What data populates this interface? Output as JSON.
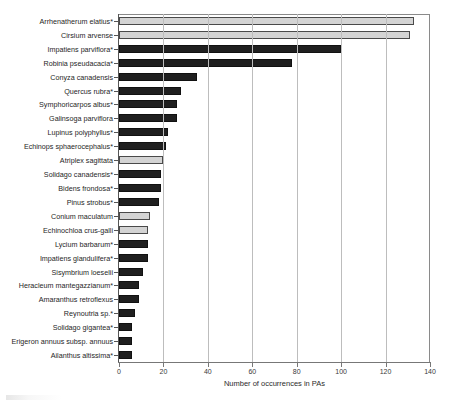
{
  "chart_data": {
    "type": "bar",
    "orientation": "horizontal",
    "title": "",
    "xlabel": "Number of occurrences in PAs",
    "ylabel": "",
    "xlim": [
      0,
      140
    ],
    "xticks": [
      0,
      20,
      40,
      60,
      80,
      100,
      120,
      140
    ],
    "grid": true,
    "legend": null,
    "categories": [
      "Arrhenatherum elatius*",
      "Cirsium arvense",
      "Impatiens parviflora*",
      "Robinia pseudacacia*",
      "Conyza canadensis",
      "Quercus rubra*",
      "Symphoricarpos albus*",
      "Galinsoga parviflora",
      "Lupinus polyphyllus*",
      "Echinops sphaerocephalus*",
      "Atriplex sagittata",
      "Solidago canadensis*",
      "Bidens frondosa*",
      "Pinus strobus*",
      "Conium maculatum",
      "Echinochloa crus-galli",
      "Lycium barbarum*",
      "Impatiens glandulifera*",
      "Sisymbrium loeselii",
      "Heracleum mantegazzianum*",
      "Amaranthus retroflexus",
      "Reynoutria sp.*",
      "Solidago gigantea*",
      "Erigeron annuus subsp. annuus",
      "Ailanthus altissima*"
    ],
    "values": [
      133,
      131,
      100,
      78,
      35,
      28,
      26,
      26,
      22,
      21,
      20,
      19,
      19,
      18,
      14,
      13,
      13,
      13,
      11,
      9,
      9,
      7,
      6,
      6,
      6
    ],
    "bar_styles": [
      "light",
      "light",
      "dark",
      "dark",
      "dark",
      "dark",
      "dark",
      "dark",
      "dark",
      "dark",
      "light",
      "dark",
      "dark",
      "dark",
      "light",
      "light",
      "dark",
      "dark",
      "dark",
      "dark",
      "dark",
      "dark",
      "dark",
      "dark",
      "dark"
    ],
    "colors": {
      "dark_fill": "#1f1f1f",
      "light_fill": "#d4d4d4",
      "bar_outline": "#4a4a4a",
      "gridline": "#bdbdbd",
      "axis": "#555555",
      "text": "#262626"
    }
  }
}
